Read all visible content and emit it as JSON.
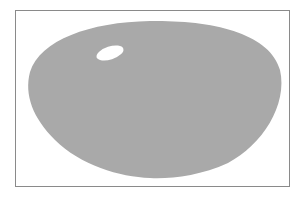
{
  "diagram": {
    "frame": {
      "border_color": "#8a8a8a",
      "background": "#ffffff"
    },
    "blob": {
      "fill": "#a9a9a9",
      "shape": "rounded-trapezoid-oval"
    },
    "highlight": {
      "fill": "#ffffff",
      "shape": "ellipse"
    }
  }
}
